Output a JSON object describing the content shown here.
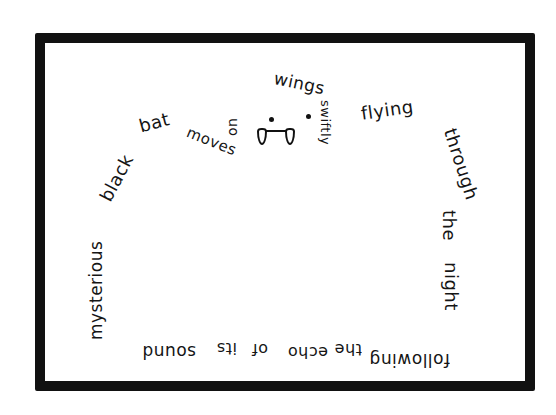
{
  "poem": {
    "type": "concrete shape poem (bat)",
    "words": {
      "mysterious": "mysterious",
      "black": "black",
      "bat": "bat",
      "moves": "moves",
      "on": "on",
      "silent": "silest",
      "wings": "wings",
      "swiftly": "swiftly",
      "flying": "flying",
      "through": "through",
      "the": "the",
      "night": "night",
      "following": "following",
      "the_bottom": "the",
      "echo": "echo",
      "of": "of",
      "its": "its",
      "sound": "sound"
    },
    "full_text": "mysterious black bat moves on silest wings swiftly flying through the night following the echo of its sound"
  },
  "colors": {
    "ink": "#151515",
    "frame": "#111111",
    "paper": "#ffffff"
  }
}
